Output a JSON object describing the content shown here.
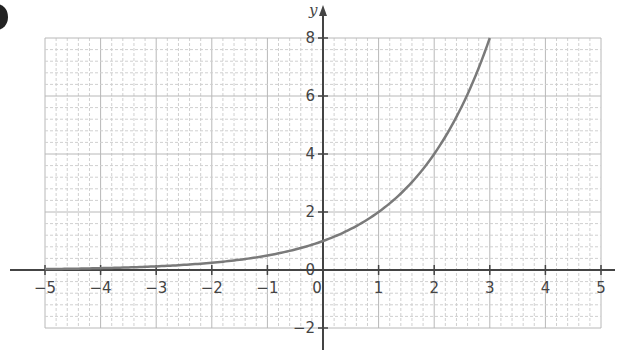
{
  "chart_data": {
    "type": "line",
    "title": "",
    "function": "y = 2^x",
    "xlabel": "",
    "ylabel": "y",
    "xlim": [
      -5,
      5
    ],
    "ylim": [
      -2,
      8
    ],
    "x_ticks": [
      -5,
      -4,
      -3,
      -2,
      -1,
      0,
      1,
      2,
      3,
      4,
      5
    ],
    "x_tick_labels": [
      "−5",
      "−4",
      "−3",
      "−2",
      "−1",
      "0",
      "1",
      "2",
      "3",
      "4",
      "5"
    ],
    "y_ticks": [
      -2,
      2,
      4,
      6,
      8
    ],
    "y_tick_labels": [
      "−2",
      "2",
      "4",
      "6",
      "8"
    ],
    "grid": true,
    "grid_minor_x_step": 0.2,
    "grid_minor_y_step": 0.4,
    "series": [
      {
        "name": "y = 2^x",
        "x": [
          -5,
          -4,
          -3,
          -2,
          -1,
          0,
          1,
          2,
          3
        ],
        "y": [
          0.03125,
          0.0625,
          0.125,
          0.25,
          0.5,
          1,
          2,
          4,
          8
        ],
        "color": "#7a7a7a"
      }
    ],
    "legend": null
  },
  "colors": {
    "axis": "#444444",
    "grid_major": "#b8b8b8",
    "grid_minor": "#d0d0d0",
    "curve": "#7a7a7a"
  }
}
